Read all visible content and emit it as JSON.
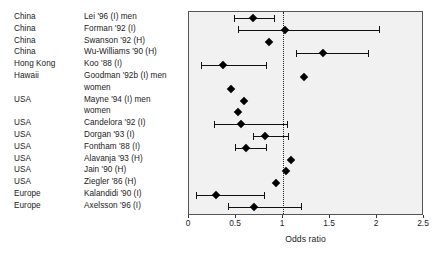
{
  "chart_data": {
    "type": "scatter",
    "title": "",
    "xlabel": "Odds ratio",
    "ylabel": "",
    "xlim": [
      0,
      2.5
    ],
    "xticks": [
      0,
      0.5,
      1,
      1.5,
      2,
      2.5
    ],
    "xtick_labels": [
      "0",
      "0.5",
      "1",
      "1.5",
      "2",
      "2.5"
    ],
    "grid": false,
    "legend": "none",
    "reference_line": 1,
    "reference_line_style": "dotted",
    "columns": [
      "Country",
      "Study"
    ],
    "rows": [
      {
        "country": "China",
        "study": "Lei '96 (I) men",
        "or": 0.68,
        "lo": 0.48,
        "hi": 0.9
      },
      {
        "country": "China",
        "study": "Forman '92 (I)",
        "or": 1.02,
        "lo": 0.52,
        "hi": 2.02
      },
      {
        "country": "China",
        "study": "Swanson '92 (H)",
        "or": 0.85,
        "lo": null,
        "hi": null
      },
      {
        "country": "China",
        "study": "Wu-Williams '90 (H)",
        "or": 1.43,
        "lo": 1.14,
        "hi": 1.9
      },
      {
        "country": "Hong Kong",
        "study": "Koo '88 (I)",
        "or": 0.36,
        "lo": 0.13,
        "hi": 0.82
      },
      {
        "country": "Hawaii",
        "study": "Goodman '92b (I) men",
        "or": 1.22,
        "lo": null,
        "hi": null
      },
      {
        "country": "",
        "study": "women",
        "or": 0.45,
        "lo": null,
        "hi": null
      },
      {
        "country": "USA",
        "study": "Mayne '94 (I) men",
        "or": 0.58,
        "lo": null,
        "hi": null
      },
      {
        "country": "",
        "study": "women",
        "or": 0.52,
        "lo": null,
        "hi": null
      },
      {
        "country": "USA",
        "study": "Candelora '92 (I)",
        "or": 0.55,
        "lo": 0.27,
        "hi": 1.04
      },
      {
        "country": "USA",
        "study": "Dorgan '93 (I)",
        "or": 0.81,
        "lo": 0.68,
        "hi": 1.05
      },
      {
        "country": "USA",
        "study": "Fontham '88 (I)",
        "or": 0.61,
        "lo": 0.49,
        "hi": 0.82
      },
      {
        "country": "USA",
        "study": "Alavanja '93 (H)",
        "or": 1.09,
        "lo": null,
        "hi": null
      },
      {
        "country": "USA",
        "study": "Jain '90 (H)",
        "or": 1.03,
        "lo": null,
        "hi": null
      },
      {
        "country": "USA",
        "study": "Ziegler '86 (H)",
        "or": 0.93,
        "lo": null,
        "hi": null
      },
      {
        "country": "Europe",
        "study": "Kalandidi '90 (I)",
        "or": 0.29,
        "lo": 0.07,
        "hi": 0.8
      },
      {
        "country": "Europe",
        "study": "Axelsson '96 (I)",
        "or": 0.69,
        "lo": 0.41,
        "hi": 1.19
      }
    ]
  },
  "colors": {
    "panel_background": "#f1f1f1",
    "panel_border": "#555555",
    "marker": "#000000",
    "reference_line": "#222222",
    "text": "#1a1a1a"
  }
}
